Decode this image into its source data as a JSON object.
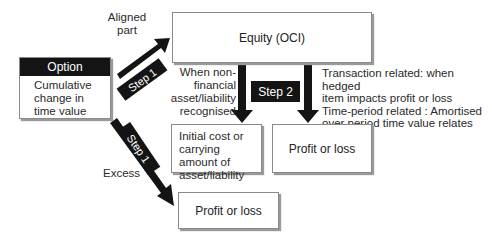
{
  "option_box": {
    "header": "Option",
    "body": "Cumulative change in time value"
  },
  "equity_box": {
    "label": "Equity (OCI)"
  },
  "initial_cost_box": {
    "label": "Initial cost or carrying amount of asset/liability"
  },
  "profit_loss_right": {
    "label": "Profit or loss"
  },
  "profit_loss_bottom": {
    "label": "Profit or loss"
  },
  "arrows": {
    "aligned": {
      "label": "Aligned part",
      "step": "Step 1"
    },
    "excess": {
      "label": "Excess",
      "step": "Step 1"
    },
    "to_initial_cost": {
      "label": "When non-financial asset/liability recognised"
    },
    "to_profit_loss": {
      "step": "Step 2",
      "note_line1": "Transaction related: when hedged",
      "note_line2": "item impacts profit or loss",
      "note_line3": "Time-period related : Amortised",
      "note_line4": "over period time value relates"
    }
  },
  "colors": {
    "arrow": "#141414",
    "box_border": "#8a8a8a",
    "shadow": "#9a9a9a"
  }
}
